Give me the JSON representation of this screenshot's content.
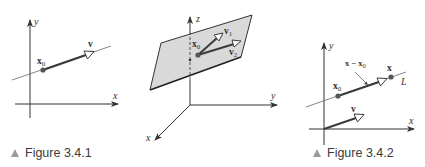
{
  "colors": {
    "axis": "#333333",
    "line": "#555555",
    "vector": "#3a3a3a",
    "point": "#555555",
    "plane_fill": "#d9d9d9",
    "plane_edge": "#333333",
    "caption_marker": "#9a9a9a"
  },
  "figures": [
    {
      "id": "fig-3-4-1",
      "caption": "Figure 3.4.1",
      "labels": {
        "y_axis": "y",
        "x_axis": "x",
        "point": "x0",
        "point_sub": "0",
        "point_base": "x",
        "vector": "v"
      }
    },
    {
      "id": "fig-3d-plane",
      "caption": "",
      "labels": {
        "z_axis": "z",
        "y_axis": "y",
        "x_axis": "x",
        "point_base": "x",
        "point_sub": "0",
        "vector1_base": "v",
        "vector1_sub": "1",
        "vector2_base": "v",
        "vector2_sub": "2"
      }
    },
    {
      "id": "fig-3-4-2",
      "caption": "Figure 3.4.2",
      "labels": {
        "y_axis": "y",
        "x_axis": "x",
        "point0_base": "x",
        "point0_sub": "0",
        "point_x": "x",
        "diff_base": "x − x",
        "diff_sub": "0",
        "line": "L",
        "vector": "v"
      }
    }
  ]
}
